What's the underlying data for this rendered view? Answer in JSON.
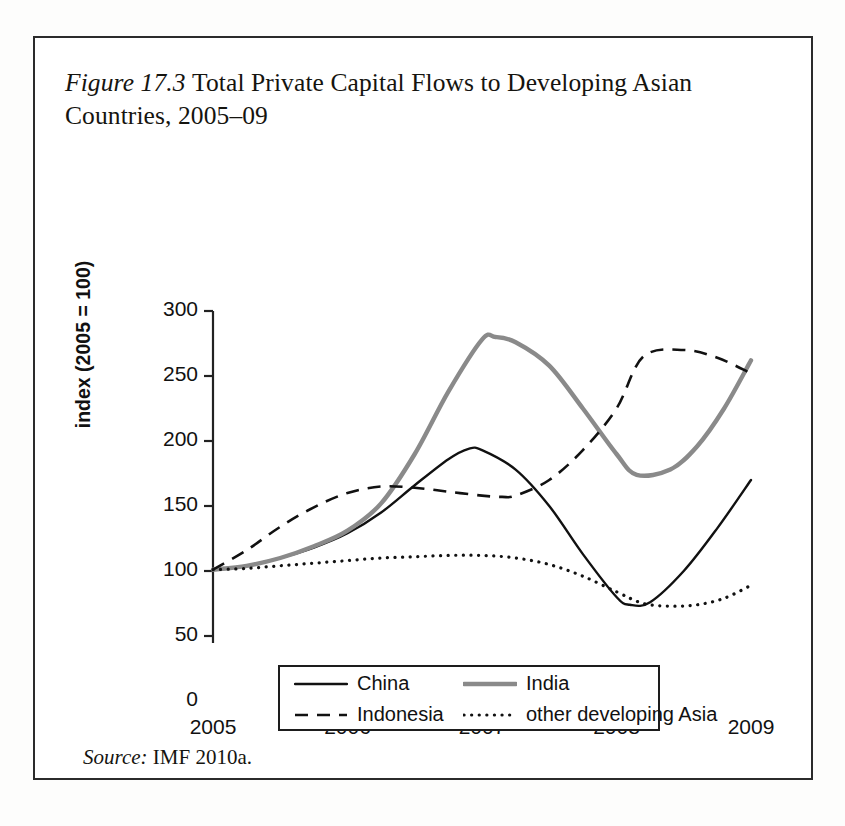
{
  "figure": {
    "label": "Figure 17.3",
    "title_text": "Total Private Capital Flows to Developing Asian Countries, 2005–09",
    "source_label": "Source:",
    "source_text": "IMF 2010a."
  },
  "legend": {
    "items": [
      {
        "label": "China",
        "style": "solid",
        "color": "#111111"
      },
      {
        "label": "India",
        "style": "solid-thick",
        "color": "#8a8a8a"
      },
      {
        "label": "Indonesia",
        "style": "dashed",
        "color": "#111111"
      },
      {
        "label": "other developing Asia",
        "style": "dotted",
        "color": "#111111"
      }
    ]
  },
  "chart_data": {
    "type": "line",
    "xlabel": "",
    "ylabel": "index (2005 = 100)",
    "xlim": [
      2005,
      2009
    ],
    "ylim": [
      0,
      300
    ],
    "xticks": [
      "2005",
      "2006",
      "2007",
      "2008",
      "2009"
    ],
    "yticks": [
      "0",
      "50",
      "100",
      "150",
      "200",
      "250",
      "300"
    ],
    "grid": false,
    "legend_position": "bottom",
    "series": [
      {
        "name": "China",
        "color": "#111111",
        "style": "solid",
        "x": [
          2005,
          2005.25,
          2005.5,
          2005.75,
          2006,
          2006.25,
          2006.5,
          2006.75,
          2006.9,
          2007,
          2007.25,
          2007.5,
          2007.75,
          2008,
          2008.1,
          2008.25,
          2008.5,
          2008.75,
          2009
        ],
        "y": [
          101,
          104,
          110,
          118,
          129,
          145,
          166,
          186,
          194,
          193,
          178,
          150,
          113,
          80,
          74,
          76,
          100,
          133,
          170
        ]
      },
      {
        "name": "India",
        "color": "#8a8a8a",
        "style": "solid-thick",
        "x": [
          2005,
          2005.25,
          2005.5,
          2005.75,
          2006,
          2006.25,
          2006.5,
          2006.75,
          2007,
          2007.1,
          2007.25,
          2007.5,
          2007.75,
          2008,
          2008.15,
          2008.4,
          2008.6,
          2008.8,
          2009
        ],
        "y": [
          101,
          104,
          110,
          119,
          131,
          152,
          190,
          238,
          278,
          280,
          276,
          258,
          225,
          190,
          174,
          178,
          196,
          225,
          262
        ]
      },
      {
        "name": "Indonesia",
        "color": "#111111",
        "style": "dashed",
        "x": [
          2005,
          2005.25,
          2005.5,
          2005.75,
          2006,
          2006.25,
          2006.5,
          2006.75,
          2007,
          2007.15,
          2007.25,
          2007.5,
          2007.75,
          2008,
          2008.2,
          2008.5,
          2008.75,
          2009
        ],
        "y": [
          101,
          116,
          134,
          149,
          160,
          165,
          164,
          161,
          158,
          157,
          158,
          170,
          193,
          225,
          265,
          270,
          264,
          252
        ]
      },
      {
        "name": "other developing Asia",
        "color": "#111111",
        "style": "dotted",
        "x": [
          2005,
          2005.25,
          2005.5,
          2005.75,
          2006,
          2006.25,
          2006.5,
          2006.75,
          2007,
          2007.25,
          2007.5,
          2007.75,
          2008,
          2008.2,
          2008.4,
          2008.6,
          2008.8,
          2009
        ],
        "y": [
          101,
          102,
          104,
          106,
          108,
          110,
          111,
          112,
          112,
          110,
          105,
          96,
          84,
          75,
          73,
          74,
          79,
          89
        ]
      }
    ]
  },
  "axes_geometry": {
    "note": "internal rendering helper",
    "x_px": [
      178,
      716
    ],
    "y_px": [
      558,
      168
    ]
  }
}
